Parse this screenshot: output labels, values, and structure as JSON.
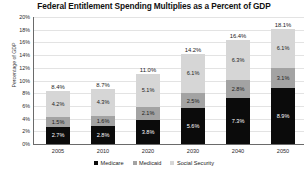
{
  "chart_data": {
    "type": "bar",
    "subtype": "stacked",
    "title": "Federal Entitlement Spending Multiplies as a Percent of GDP",
    "xlabel": "",
    "ylabel": "Percentage of GDP",
    "categories": [
      "2005",
      "2010",
      "2020",
      "2030",
      "2040",
      "2050"
    ],
    "ylim": [
      0,
      20
    ],
    "ytick_values": [
      0,
      2,
      4,
      6,
      8,
      10,
      12,
      14,
      16,
      18,
      20
    ],
    "ytick_labels": [
      "0%",
      "2%",
      "4%",
      "6%",
      "8%",
      "10%",
      "12%",
      "14%",
      "16%",
      "18%",
      "20%"
    ],
    "grid": true,
    "legend_position": "bottom",
    "series": [
      {
        "name": "Medicare",
        "color": "#0b0b0b",
        "values": [
          2.7,
          2.8,
          3.8,
          5.6,
          7.3,
          8.9
        ],
        "labels": [
          "2.7%",
          "2.8%",
          "3.8%",
          "5.6%",
          "7.3%",
          "8.9%"
        ]
      },
      {
        "name": "Medicaid",
        "color": "#a3a3a3",
        "values": [
          1.5,
          1.6,
          2.1,
          2.5,
          2.8,
          3.1
        ],
        "labels": [
          "1.5%",
          "1.6%",
          "2.1%",
          "2.5%",
          "2.8%",
          "3.1%"
        ]
      },
      {
        "name": "Social Security",
        "color": "#d6d6d6",
        "values": [
          4.2,
          4.3,
          5.1,
          6.1,
          6.3,
          6.1
        ],
        "labels": [
          "4.2%",
          "4.3%",
          "5.1%",
          "6.1%",
          "6.3%",
          "6.1%"
        ]
      }
    ],
    "totals": [
      8.4,
      8.7,
      11.0,
      14.2,
      16.4,
      18.1
    ],
    "total_labels": [
      "8.4%",
      "8.7%",
      "11.0%",
      "14.2%",
      "16.4%",
      "18.1%"
    ]
  }
}
